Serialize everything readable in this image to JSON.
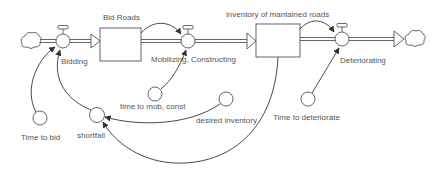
{
  "diagram": {
    "type": "stock-and-flow",
    "stocks": [
      {
        "id": "bid_roads",
        "label": "Bid Roads"
      },
      {
        "id": "inventory",
        "label": "inventory of mantained roads"
      }
    ],
    "flows": [
      {
        "id": "bidding",
        "label": "Bidding",
        "from": "source-cloud",
        "to": "bid_roads"
      },
      {
        "id": "mobilizing",
        "label": "Mobilizing, Constructing",
        "from": "bid_roads",
        "to": "inventory"
      },
      {
        "id": "deteriorating",
        "label": "Deteriorating",
        "from": "inventory",
        "to": "sink-cloud"
      }
    ],
    "auxiliaries": [
      {
        "id": "time_to_bid",
        "label": "Time to bid"
      },
      {
        "id": "shortfall",
        "label": "shortfall"
      },
      {
        "id": "time_to_mob",
        "label": "time to mob, const"
      },
      {
        "id": "desired_inventory",
        "label": "desired inventory"
      },
      {
        "id": "time_to_deteriorate",
        "label": "Time to deteriorate"
      }
    ],
    "links": [
      {
        "from": "time_to_bid",
        "to": "bidding"
      },
      {
        "from": "shortfall",
        "to": "bidding"
      },
      {
        "from": "bid_roads",
        "to": "mobilizing"
      },
      {
        "from": "time_to_mob",
        "to": "mobilizing"
      },
      {
        "from": "inventory",
        "to": "deteriorating"
      },
      {
        "from": "time_to_deteriorate",
        "to": "deteriorating"
      },
      {
        "from": "desired_inventory",
        "to": "shortfall"
      },
      {
        "from": "inventory",
        "to": "shortfall"
      }
    ],
    "colors": {
      "line": "#333333",
      "text": "#555555",
      "fill": "#ffffff"
    }
  }
}
